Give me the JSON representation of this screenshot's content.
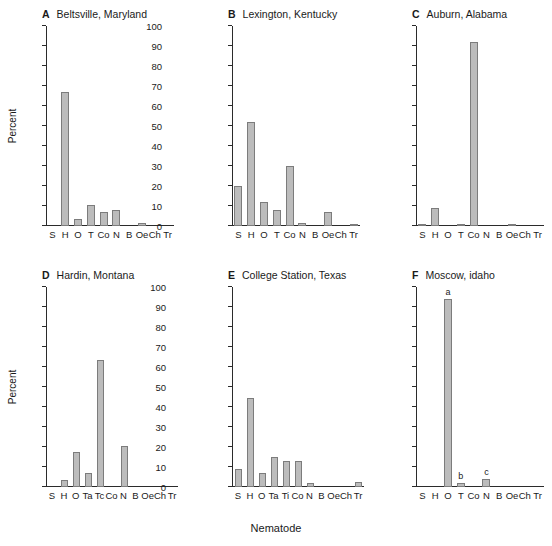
{
  "figure": {
    "xaxis_title": "Nematode",
    "yaxis_title": "Percent",
    "bar_color": "#bcbcbc",
    "bar_border_color": "#7c7c7c",
    "axis_color": "#2b2b2b"
  },
  "axis": {
    "ytick_labels": [
      "0",
      "10",
      "20",
      "30",
      "40",
      "50",
      "60",
      "70",
      "80",
      "90",
      "100"
    ],
    "ymin": 0,
    "ymax": 100
  },
  "chart_data": [
    {
      "type": "bar",
      "panel": "A",
      "title": "Beltsville, Maryland",
      "categories": [
        "S",
        "H",
        "O",
        "T",
        "Co",
        "N",
        "B",
        "Oe",
        "Ch",
        "Tr"
      ],
      "values": [
        0,
        67,
        3.5,
        10.5,
        7,
        8,
        0,
        1.5,
        0,
        0
      ],
      "annotations": [
        "",
        "",
        "",
        "",
        "",
        "",
        "",
        "",
        "",
        ""
      ],
      "xlabel": "Nematode",
      "ylabel": "Percent",
      "ylim": [
        0,
        100
      ],
      "grid": false,
      "legend": "none"
    },
    {
      "type": "bar",
      "panel": "B",
      "title": "Lexington, Kentucky",
      "categories": [
        "S",
        "H",
        "O",
        "T",
        "Co",
        "N",
        "B",
        "Oe",
        "Ch",
        "Tr"
      ],
      "values": [
        20,
        52,
        12,
        8,
        30,
        1.5,
        0,
        7,
        0,
        1
      ],
      "annotations": [
        "",
        "",
        "",
        "",
        "",
        "",
        "",
        "",
        "",
        ""
      ],
      "xlabel": "Nematode",
      "ylabel": "Percent",
      "ylim": [
        0,
        100
      ],
      "grid": false,
      "legend": "none"
    },
    {
      "type": "bar",
      "panel": "C",
      "title": "Auburn, Alabama",
      "categories": [
        "S",
        "H",
        "O",
        "T",
        "Co",
        "N",
        "B",
        "Oe",
        "Ch",
        "Tr"
      ],
      "values": [
        1,
        9,
        0,
        1,
        92,
        0,
        0,
        1,
        0,
        0
      ],
      "annotations": [
        "",
        "",
        "",
        "",
        "",
        "",
        "",
        "",
        "",
        ""
      ],
      "xlabel": "Nematode",
      "ylabel": "Percent",
      "ylim": [
        0,
        100
      ],
      "grid": false,
      "legend": "none"
    },
    {
      "type": "bar",
      "panel": "D",
      "title": "Hardin, Montana",
      "categories": [
        "S",
        "H",
        "O",
        "Ta",
        "Tc",
        "Co",
        "N",
        "B",
        "Oe",
        "Ch",
        "Tr"
      ],
      "values": [
        0,
        3.5,
        17.5,
        7,
        63.5,
        0,
        20.5,
        0,
        0,
        0,
        0
      ],
      "annotations": [
        "",
        "",
        "",
        "",
        "",
        "",
        "",
        "",
        "",
        "",
        ""
      ],
      "xlabel": "Nematode",
      "ylabel": "Percent",
      "ylim": [
        0,
        100
      ],
      "grid": false,
      "legend": "none"
    },
    {
      "type": "bar",
      "panel": "E",
      "title": "College Station, Texas",
      "categories": [
        "S",
        "H",
        "O",
        "Ta",
        "Ti",
        "Co",
        "N",
        "B",
        "Oe",
        "Ch",
        "Tr"
      ],
      "values": [
        9,
        44.5,
        7,
        15,
        13,
        13,
        2,
        0,
        0,
        0,
        2.5
      ],
      "annotations": [
        "",
        "",
        "",
        "",
        "",
        "",
        "",
        "",
        "",
        "",
        ""
      ],
      "xlabel": "Nematode",
      "ylabel": "Percent",
      "ylim": [
        0,
        100
      ],
      "grid": false,
      "legend": "none"
    },
    {
      "type": "bar",
      "panel": "F",
      "title": "Moscow, idaho",
      "categories": [
        "S",
        "H",
        "O",
        "T",
        "Co",
        "N",
        "B",
        "Oe",
        "Ch",
        "Tr"
      ],
      "values": [
        0,
        0,
        94,
        2,
        0,
        4,
        0,
        0,
        0,
        0
      ],
      "annotations": [
        "",
        "",
        "a",
        "b",
        "",
        "c",
        "",
        "",
        "",
        ""
      ],
      "xlabel": "Nematode",
      "ylabel": "Percent",
      "ylim": [
        0,
        100
      ],
      "grid": false,
      "legend": "none"
    }
  ]
}
